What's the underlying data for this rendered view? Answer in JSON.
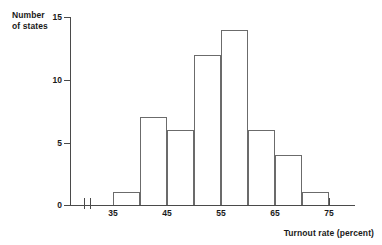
{
  "chart_data": {
    "type": "bar",
    "title": "",
    "xlabel": "Turnout rate (percent)",
    "ylabel": "Number of states",
    "ylabel_lines": [
      "Number",
      "of states"
    ],
    "categories": [
      "35-40",
      "40-45",
      "45-50",
      "50-55",
      "55-60",
      "60-65",
      "65-70",
      "70-75"
    ],
    "bin_edges": [
      35,
      40,
      45,
      50,
      55,
      60,
      65,
      70,
      75
    ],
    "values": [
      1,
      7,
      6,
      12,
      14,
      6,
      4,
      1
    ],
    "xlim": [
      35,
      80
    ],
    "ylim": [
      0,
      15
    ],
    "xtick_values": [
      35,
      40,
      45,
      50,
      55,
      60,
      65,
      70,
      75
    ],
    "xtick_labels": [
      "35",
      "",
      "45",
      "",
      "55",
      "",
      "65",
      "",
      "75"
    ],
    "ytick_values": [
      0,
      5,
      10,
      15
    ],
    "ytick_labels": [
      "0",
      "5",
      "10",
      "15"
    ],
    "grid": false,
    "legend": false,
    "axis_break": true,
    "bar_edge_color": "#6b6b6b",
    "bar_fill_color": "transparent",
    "axis_color": "#4a4a4a",
    "text_color": "#1a1a1a"
  }
}
